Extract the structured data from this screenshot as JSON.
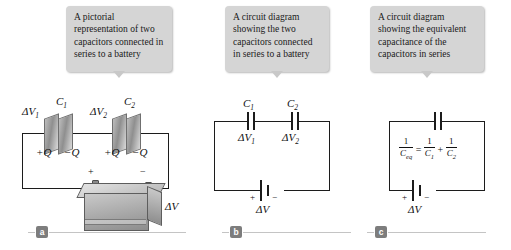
{
  "figure": {
    "title": "Capacitors connected in series",
    "background_color": "#ffffff",
    "wire_color": "#1c1c1c",
    "callout_color": "#d5d5d5",
    "marker_color": "#7d7d7d"
  },
  "panels": [
    {
      "marker": "a",
      "caption": "A pictorial representation of two capacitors connected in series to a battery",
      "labels": {
        "cap1_name": "C",
        "cap1_sub": "1",
        "cap2_name": "C",
        "cap2_sub": "2",
        "dv1": "ΔV",
        "dv1_sub": "1",
        "dv2": "ΔV",
        "dv2_sub": "2",
        "charge_pos_1": "+Q",
        "charge_neg_1": "−Q",
        "charge_pos_2": "+Q",
        "charge_neg_2": "−Q",
        "battery_plus": "+",
        "battery_minus": "−",
        "battery_dv": "ΔV"
      }
    },
    {
      "marker": "b",
      "caption": "A circuit diagram showing the two capacitors connected in series to a battery",
      "labels": {
        "cap1_name": "C",
        "cap1_sub": "1",
        "cap2_name": "C",
        "cap2_sub": "2",
        "dv1": "ΔV",
        "dv1_sub": "1",
        "dv2": "ΔV",
        "dv2_sub": "2",
        "battery_plus": "+",
        "battery_minus": "−",
        "battery_dv": "ΔV"
      }
    },
    {
      "marker": "c",
      "caption": "A circuit diagram showing the equivalent capacitance of the capacitors in series",
      "equation": {
        "lhs_num": "1",
        "lhs_den": "C",
        "lhs_den_sub": "eq",
        "equals": "=",
        "t1_num": "1",
        "t1_den": "C",
        "t1_den_sub": "1",
        "plus": "+",
        "t2_num": "1",
        "t2_den": "C",
        "t2_den_sub": "2"
      },
      "labels": {
        "battery_plus": "+",
        "battery_minus": "−",
        "battery_dv": "ΔV"
      }
    }
  ]
}
